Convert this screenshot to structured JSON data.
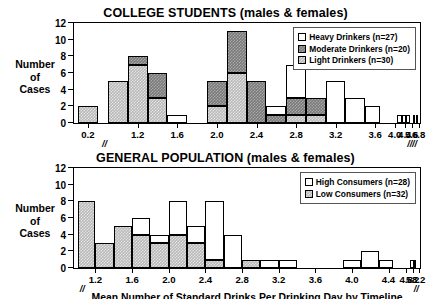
{
  "figure": {
    "ylabel_lines": [
      "Number",
      "of",
      "Cases"
    ],
    "xlabel": "Mean Number of Standard Drinks Per Drinking Day by Timeline",
    "break_glyph": "//"
  },
  "chart_data": [
    {
      "type": "bar",
      "title": "COLLEGE STUDENTS (males & females)",
      "xlabel": "Mean Number of Standard Drinks Per Drinking Day by Timeline",
      "ylabel": "Number of Cases",
      "ylim": [
        0,
        12
      ],
      "yticks": [
        0,
        2,
        4,
        6,
        8,
        10,
        12
      ],
      "xticks": [
        "0.2",
        "1.2",
        "1.6",
        "2.0",
        "2.4",
        "2.8",
        "3.2",
        "3.6",
        "4.0",
        "4.4",
        "5.6",
        "6.8"
      ],
      "xtick_positions": [
        0.2,
        1.2,
        1.6,
        2.0,
        2.4,
        2.8,
        3.2,
        3.6,
        4.0,
        4.4,
        5.6,
        6.8
      ],
      "axis_breaks": [
        0.7,
        4.8,
        6.0
      ],
      "grid": false,
      "legend_position": "top-right",
      "stacked": true,
      "bin_width": 0.2,
      "bin_starts": [
        0.1,
        0.9,
        1.1,
        1.3,
        1.5,
        1.9,
        2.1,
        2.3,
        2.5,
        2.7,
        2.9,
        3.1,
        3.3,
        3.5,
        4.1,
        4.3,
        4.5,
        5.7,
        6.5
      ],
      "bin_labels": [
        "0.1-0.3",
        "0.9-1.1",
        "1.1-1.3",
        "1.3-1.5",
        "1.5-1.7",
        "1.9-2.1",
        "2.1-2.3",
        "2.3-2.5",
        "2.5-2.7",
        "2.7-2.9",
        "2.9-3.1",
        "3.1-3.3",
        "3.3-3.5",
        "3.5-3.7",
        "4.1-4.3",
        "4.3-4.5",
        "4.5-4.7",
        "5.7-5.9",
        "6.5-6.7"
      ],
      "series": [
        {
          "name": "Light Drinkers (n=30)",
          "fill": "light",
          "values": [
            2,
            5,
            7,
            3,
            0,
            2,
            6,
            0,
            0,
            1,
            1,
            0,
            0,
            0,
            0,
            0,
            0,
            0,
            0
          ]
        },
        {
          "name": "Moderate Drinkers (n=20)",
          "fill": "moderate",
          "values": [
            0,
            0,
            1,
            3,
            0,
            3,
            5,
            5,
            1,
            2,
            2,
            0,
            0,
            0,
            0,
            0,
            0,
            0,
            0
          ]
        },
        {
          "name": "Heavy Drinkers (n=27)",
          "fill": "white",
          "values": [
            0,
            0,
            0,
            0,
            1,
            0,
            0,
            0,
            1,
            4,
            0,
            5,
            3,
            2,
            1,
            1,
            1,
            1,
            1
          ]
        }
      ],
      "totals": [
        2,
        5,
        8,
        6,
        1,
        5,
        11,
        7,
        2,
        6,
        7,
        3,
        5,
        3,
        2,
        1,
        1,
        1,
        1
      ],
      "legend": [
        {
          "label": "Heavy Drinkers (n=27)",
          "fill": "white"
        },
        {
          "label": "Moderate Drinkers (n=20)",
          "fill": "moderate"
        },
        {
          "label": "Light Drinkers (n=30)",
          "fill": "light"
        }
      ]
    },
    {
      "type": "bar",
      "title": "GENERAL POPULATION (males & females)",
      "xlabel": "Mean Number of Standard Drinks Per Drinking Day by Timeline",
      "ylabel": "Number of Cases",
      "ylim": [
        0,
        12
      ],
      "yticks": [
        0,
        2,
        4,
        6,
        8,
        10,
        12
      ],
      "xticks": [
        "1.2",
        "1.6",
        "2.0",
        "2.4",
        "2.8",
        "3.2",
        "3.6",
        "4.0",
        "4.4",
        "4.8",
        "5.2",
        "8.2"
      ],
      "xtick_positions": [
        1.2,
        1.6,
        2.0,
        2.4,
        2.8,
        3.2,
        3.6,
        4.0,
        4.4,
        4.8,
        5.2,
        8.2
      ],
      "axis_breaks": [
        1.05,
        5.5
      ],
      "grid": false,
      "legend_position": "top-right",
      "stacked": true,
      "bin_width": 0.2,
      "bin_starts": [
        1.0,
        1.2,
        1.4,
        1.6,
        1.8,
        2.0,
        2.2,
        2.4,
        2.6,
        2.8,
        3.0,
        3.2,
        3.9,
        4.1,
        4.3,
        5.1,
        5.3
      ],
      "bin_labels": [
        "1.0-1.2",
        "1.2-1.4",
        "1.4-1.6",
        "1.6-1.8",
        "1.8-2.0",
        "2.0-2.2",
        "2.2-2.4",
        "2.4-2.6",
        "2.6-2.8",
        "2.8-3.0",
        "3.0-3.2",
        "3.2-3.4",
        "3.9-4.1",
        "4.1-4.3",
        "4.3-4.5",
        "5.1-5.3",
        "5.3-5.5"
      ],
      "series": [
        {
          "name": "Low Consumers (n=32)",
          "fill": "light",
          "values": [
            8,
            3,
            5,
            4,
            3,
            4,
            3,
            1,
            0,
            1,
            0,
            0,
            0,
            0,
            0,
            0,
            0
          ]
        },
        {
          "name": "High Consumers (n=28)",
          "fill": "white",
          "values": [
            0,
            0,
            0,
            2,
            1,
            4,
            2,
            7,
            4,
            0,
            1,
            1,
            1,
            2,
            1,
            1,
            1
          ]
        }
      ],
      "totals": [
        8,
        3,
        5,
        6,
        4,
        8,
        5,
        7,
        5,
        1,
        1,
        1,
        1,
        2,
        1,
        1,
        1
      ],
      "legend": [
        {
          "label": "High Consumers (n=28)",
          "fill": "white"
        },
        {
          "label": "Low Consumers (n=32)",
          "fill": "light"
        }
      ]
    }
  ]
}
